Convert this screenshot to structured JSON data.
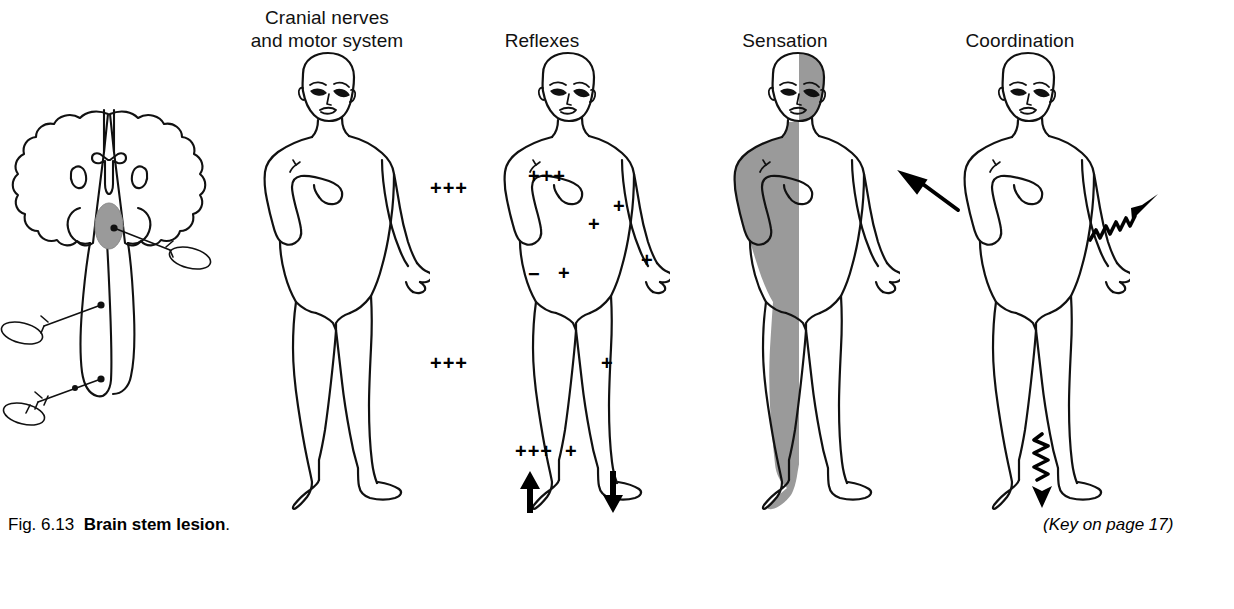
{
  "figure": {
    "caption_prefix": "Fig. 6.13",
    "caption_title": "Brain stem lesion",
    "caption_suffix": ".",
    "key_note": "(Key on page 17)"
  },
  "columns": [
    {
      "id": "brainstem",
      "label": ""
    },
    {
      "id": "cranial-nerves",
      "label": "Cranial nerves\nand motor system"
    },
    {
      "id": "reflexes",
      "label": "Reflexes"
    },
    {
      "id": "sensation",
      "label": "Sensation"
    },
    {
      "id": "coordination",
      "label": "Coordination"
    }
  ],
  "reflex_marks": [
    {
      "id": "biceps-left",
      "text": "+++",
      "side": "left",
      "region": "upper-arm"
    },
    {
      "id": "pectoral-left",
      "text": "+++",
      "side": "left",
      "region": "chest"
    },
    {
      "id": "biceps-right",
      "text": "+",
      "side": "right",
      "region": "upper-arm"
    },
    {
      "id": "triceps-right",
      "text": "+",
      "side": "right",
      "region": "elbow"
    },
    {
      "id": "brachioradialis-right",
      "text": "+",
      "side": "right",
      "region": "forearm"
    },
    {
      "id": "abdominal-left",
      "text": "−",
      "side": "left",
      "region": "abdomen"
    },
    {
      "id": "abdominal-right",
      "text": "+",
      "side": "right",
      "region": "abdomen"
    },
    {
      "id": "knee-left",
      "text": "+++",
      "side": "left",
      "region": "knee"
    },
    {
      "id": "knee-right",
      "text": "+",
      "side": "right",
      "region": "knee"
    },
    {
      "id": "ankle-left",
      "text": "+++",
      "side": "left",
      "region": "ankle"
    },
    {
      "id": "ankle-right",
      "text": "+",
      "side": "right",
      "region": "ankle"
    }
  ],
  "plantar_responses": [
    {
      "id": "plantar-left",
      "direction": "up"
    },
    {
      "id": "plantar-right",
      "direction": "down"
    }
  ],
  "coordination_arrows": [
    {
      "id": "coordination-arm-left",
      "style": "straight",
      "direction": "up-left"
    },
    {
      "id": "coordination-arm-right",
      "style": "zigzag",
      "direction": "up-right"
    },
    {
      "id": "coordination-leg-right",
      "style": "zigzag",
      "direction": "down"
    }
  ],
  "sensation_shading": {
    "body_side": "left",
    "face_side": "right",
    "color": "#9a9a9a"
  },
  "colors": {
    "ink": "#111111",
    "lesion": "#9a9a9a",
    "shade": "#9a9a9a",
    "page": "#ffffff"
  }
}
